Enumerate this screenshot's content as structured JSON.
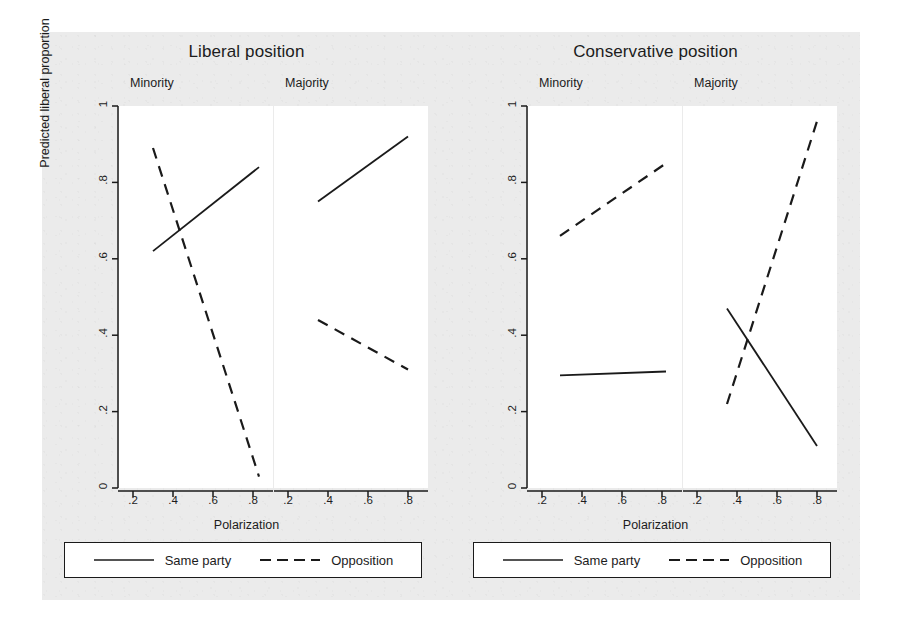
{
  "figure": {
    "background_color": "#ebebeb",
    "ylabel": "Predicted liberal proportion",
    "xlabel": "Polarization"
  },
  "legend": {
    "same_party": "Same party",
    "opposition": "Opposition",
    "same_party_style": "solid",
    "opposition_style": "dashed",
    "line_color": "#1a1a1a"
  },
  "ticks": {
    "y": [
      "0",
      ".2",
      ".4",
      ".6",
      ".8",
      "1"
    ],
    "x": [
      ".2",
      ".4",
      ".6",
      ".8"
    ]
  },
  "panels": {
    "left_supertitle": "Liberal position",
    "right_supertitle": "Conservative position",
    "minority": "Minority",
    "majority": "Majority"
  },
  "chart_data": {
    "type": "line",
    "xlabel": "Polarization",
    "ylabel": "Predicted liberal proportion",
    "xlim": [
      0.13,
      0.9
    ],
    "ylim": [
      0,
      1
    ],
    "yticks": [
      0,
      0.2,
      0.4,
      0.6,
      0.8,
      1
    ],
    "xticks": [
      0.2,
      0.4,
      0.6,
      0.8
    ],
    "grid": false,
    "legend_position": "bottom",
    "legend_entries": [
      "Same party",
      "Opposition"
    ],
    "panels": [
      {
        "supertitle": "Liberal position",
        "title": "Minority",
        "series": [
          {
            "name": "Same party",
            "style": "solid",
            "x": [
              0.3,
              0.83
            ],
            "y": [
              0.62,
              0.84
            ]
          },
          {
            "name": "Opposition",
            "style": "dashed",
            "x": [
              0.3,
              0.83
            ],
            "y": [
              0.89,
              0.03
            ]
          }
        ]
      },
      {
        "supertitle": "Liberal position",
        "title": "Majority",
        "series": [
          {
            "name": "Same party",
            "style": "solid",
            "x": [
              0.35,
              0.8
            ],
            "y": [
              0.75,
              0.92
            ]
          },
          {
            "name": "Opposition",
            "style": "dashed",
            "x": [
              0.35,
              0.8
            ],
            "y": [
              0.44,
              0.31
            ]
          }
        ]
      },
      {
        "supertitle": "Conservative position",
        "title": "Minority",
        "series": [
          {
            "name": "Same party",
            "style": "solid",
            "x": [
              0.29,
              0.82
            ],
            "y": [
              0.295,
              0.305
            ]
          },
          {
            "name": "Opposition",
            "style": "dashed",
            "x": [
              0.29,
              0.82
            ],
            "y": [
              0.66,
              0.85
            ]
          }
        ]
      },
      {
        "supertitle": "Conservative position",
        "title": "Majority",
        "series": [
          {
            "name": "Same party",
            "style": "solid",
            "x": [
              0.35,
              0.8
            ],
            "y": [
              0.47,
              0.11
            ]
          },
          {
            "name": "Opposition",
            "style": "dashed",
            "x": [
              0.35,
              0.8
            ],
            "y": [
              0.22,
              0.96
            ]
          }
        ]
      }
    ]
  }
}
